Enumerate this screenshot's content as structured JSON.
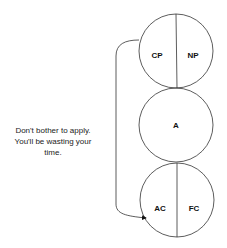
{
  "caption": {
    "lines": [
      "Don't bother to apply.",
      "You'll be wasting your",
      "time."
    ]
  },
  "circles": {
    "top": {
      "left_label": "CP",
      "right_label": "NP"
    },
    "middle": {
      "label": "A"
    },
    "bottom": {
      "left_label": "AC",
      "right_label": "FC"
    }
  },
  "colors": {
    "stroke": "#333333",
    "text": "#111111",
    "background": "#ffffff"
  }
}
